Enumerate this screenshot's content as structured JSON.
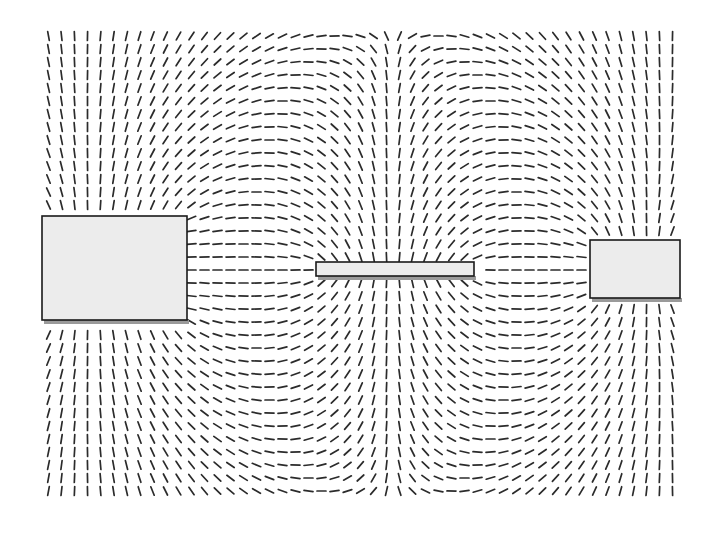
{
  "figure": {
    "width": 716,
    "height": 538,
    "background": "#ffffff",
    "dash_color": "#2b2b2b",
    "electrode_fill": "#ececec",
    "electrode_stroke": "#1a1a1a",
    "electrode_shadow": "#9a9a9a",
    "field_region": {
      "x0": 42,
      "y0": 36,
      "x1": 680,
      "y1": 500
    }
  },
  "electrodes": [
    {
      "id": "left-plate",
      "x": 42,
      "y": 216,
      "w": 145,
      "h": 104,
      "charge": 1.0
    },
    {
      "id": "center-bar",
      "x": 316,
      "y": 262,
      "w": 158,
      "h": 14,
      "charge": -1.0
    },
    {
      "id": "right-plate",
      "x": 590,
      "y": 240,
      "w": 90,
      "h": 58,
      "charge": 1.0
    }
  ]
}
